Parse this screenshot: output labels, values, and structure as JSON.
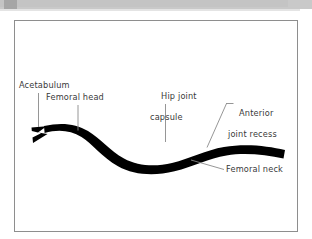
{
  "figure": {
    "type": "anatomical-line-diagram",
    "background_color": "#ffffff",
    "frame_border_color": "#8e8e8e",
    "artwork_color": "#000000",
    "leader_line_color": "#8a8a8a",
    "label_text_color": "#3a3a3a"
  },
  "header": {
    "band_color": "#c9c9c9",
    "tab_color": "#a6a6a6"
  },
  "labels": {
    "acetabulum": {
      "text": "Acetabulum",
      "leader": "vertical"
    },
    "femoral_head": {
      "text": "Femoral head",
      "leader": "vertical"
    },
    "hip_joint_capsule": {
      "line1": "Hip joint",
      "line2": "capsule",
      "leader": "vertical"
    },
    "anterior_joint_recess": {
      "line1": "Anterior",
      "line2": "joint recess",
      "leader": "diagonal-down-left"
    },
    "femoral_neck": {
      "text": "Femoral neck",
      "leader": "diagonal-up-left"
    }
  }
}
